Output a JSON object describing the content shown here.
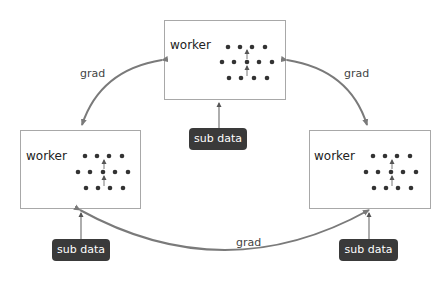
{
  "diagram": {
    "workers": [
      {
        "id": "top",
        "label": "worker"
      },
      {
        "id": "left",
        "label": "worker"
      },
      {
        "id": "right",
        "label": "worker"
      }
    ],
    "sub_data": [
      {
        "id": "top",
        "label": "sub data"
      },
      {
        "id": "left",
        "label": "sub data"
      },
      {
        "id": "right",
        "label": "sub data"
      }
    ],
    "edges": [
      {
        "from": "top",
        "to": "left",
        "label": "grad"
      },
      {
        "from": "top",
        "to": "right",
        "label": "grad"
      },
      {
        "from": "left",
        "to": "right",
        "label": "grad"
      }
    ],
    "colors": {
      "edge": "#7a7a7a",
      "badge": "#3a3a3a",
      "dot": "#333333",
      "box_border": "#a8a8a8"
    }
  }
}
